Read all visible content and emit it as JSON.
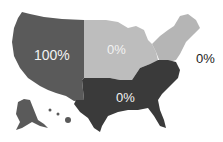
{
  "map": {
    "type": "choropleth",
    "subject": "United States regions",
    "regions": [
      {
        "name": "West",
        "label": "100%",
        "color": "#5a5a5a"
      },
      {
        "name": "Midwest",
        "label": "0%",
        "color": "#bdbdbd"
      },
      {
        "name": "Northeast",
        "label": "0%",
        "color": "#b5b5b5"
      },
      {
        "name": "South",
        "label": "0%",
        "color": "#3a3a3a"
      }
    ]
  }
}
